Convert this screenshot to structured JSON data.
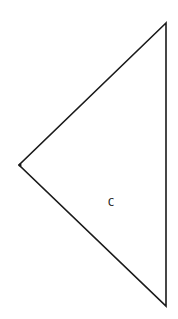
{
  "diagram": {
    "shape": "triangle",
    "stroke_color": "#1a1a1a",
    "fill_color": "#ffffff",
    "vertices": {
      "top": [
        166,
        23
      ],
      "left": [
        19,
        165
      ],
      "bottom": [
        166,
        306
      ]
    },
    "label": {
      "text": "C",
      "x": 111,
      "y": 202
    }
  }
}
